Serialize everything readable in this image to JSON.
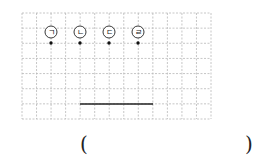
{
  "grid": {
    "x0": 22,
    "y0": 13,
    "x1": 211,
    "y1": 119,
    "cols": 13,
    "rows": 7,
    "line_color": "#b8b8b8"
  },
  "points": [
    {
      "label": "ㄱ",
      "x": 51,
      "circle_y": 32,
      "dot_y": 43
    },
    {
      "label": "ㄴ",
      "x": 80,
      "circle_y": 32,
      "dot_y": 43
    },
    {
      "label": "ㄷ",
      "x": 109,
      "circle_y": 32,
      "dot_y": 43
    },
    {
      "label": "ㄹ",
      "x": 138,
      "circle_y": 32,
      "dot_y": 43
    }
  ],
  "segment": {
    "x1": 80,
    "y1": 104,
    "x2": 153,
    "y2": 104,
    "color": "#222222"
  },
  "answer": {
    "open": "(",
    "close": ")",
    "value": ""
  }
}
